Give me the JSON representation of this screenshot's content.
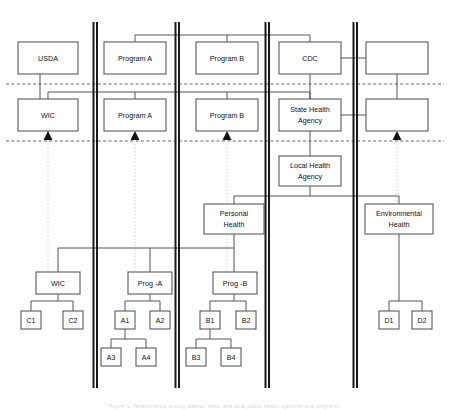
{
  "figure": {
    "caption": "Figure 1. Relationships among federal, state, and local public health agencies and programs.",
    "colors": {
      "box_stroke": "#4a4a4a",
      "connector": "#555555",
      "divider": "#1a1a1a",
      "ghost_link": "#c9c9c9",
      "text": "#111111",
      "background": "#ffffff"
    }
  },
  "tiers": {
    "federal": {
      "label": "Federal",
      "row_y": 60
    },
    "state": {
      "label": "State",
      "row_y": 115
    },
    "local": {
      "label": "Local",
      "row_y": 180
    }
  },
  "separators": [
    {
      "name": "federal-state-separator",
      "y": 84
    },
    {
      "name": "state-local-separator",
      "y": 141
    }
  ],
  "dividers": [
    {
      "name": "divider-1",
      "x": 95
    },
    {
      "name": "divider-2",
      "x": 177
    },
    {
      "name": "divider-3",
      "x": 267
    },
    {
      "name": "divider-4",
      "x": 355
    }
  ],
  "row_federal": [
    {
      "id": "usda",
      "label": "USDA",
      "x": 18,
      "y": 42,
      "w": 60,
      "h": 32
    },
    {
      "id": "fed-program-a",
      "label": "Program A",
      "x": 104,
      "y": 42,
      "w": 62,
      "h": 32
    },
    {
      "id": "fed-program-b",
      "label": "Program B",
      "x": 196,
      "y": 42,
      "w": 62,
      "h": 32
    },
    {
      "id": "cdc",
      "label": "CDC",
      "x": 279,
      "y": 42,
      "w": 62,
      "h": 32
    },
    {
      "id": "fed-blank",
      "label": "",
      "x": 366,
      "y": 42,
      "w": 62,
      "h": 32
    }
  ],
  "row_state": [
    {
      "id": "wic-state",
      "label": "WIC",
      "x": 18,
      "y": 99,
      "w": 60,
      "h": 32
    },
    {
      "id": "state-program-a",
      "label": "Program A",
      "x": 104,
      "y": 99,
      "w": 62,
      "h": 32
    },
    {
      "id": "state-program-b",
      "label": "Program B",
      "x": 196,
      "y": 99,
      "w": 62,
      "h": 32
    },
    {
      "id": "state-health-agency",
      "label": "State Health\nAgency",
      "line1": "State Health",
      "line2": "Agency",
      "x": 279,
      "y": 99,
      "w": 62,
      "h": 32
    },
    {
      "id": "state-blank",
      "label": "",
      "x": 366,
      "y": 99,
      "w": 62,
      "h": 32
    }
  ],
  "row_local": [
    {
      "id": "local-health-agency",
      "line1": "Local Health",
      "line2": "Agency",
      "x": 279,
      "y": 156,
      "w": 62,
      "h": 30
    },
    {
      "id": "personal-health",
      "line1": "Personal",
      "line2": "Health",
      "x": 204,
      "y": 204,
      "w": 60,
      "h": 30
    },
    {
      "id": "environmental-health",
      "line1": "Environmental",
      "line2": "Health",
      "x": 365,
      "y": 204,
      "w": 68,
      "h": 30
    }
  ],
  "row_programs": [
    {
      "id": "wic-local",
      "label": "WIC",
      "x": 36,
      "y": 272,
      "w": 44,
      "h": 22
    },
    {
      "id": "prog-a",
      "label": "Prog -A",
      "x": 128,
      "y": 272,
      "w": 44,
      "h": 22
    },
    {
      "id": "prog-b",
      "label": "Prog -B",
      "x": 213,
      "y": 272,
      "w": 44,
      "h": 22
    }
  ],
  "leaves": [
    {
      "id": "c1",
      "label": "C1",
      "x": 21,
      "y": 311,
      "w": 20,
      "h": 18
    },
    {
      "id": "c2",
      "label": "C2",
      "x": 63,
      "y": 311,
      "w": 20,
      "h": 18
    },
    {
      "id": "a1",
      "label": "A1",
      "x": 115,
      "y": 311,
      "w": 20,
      "h": 18
    },
    {
      "id": "a2",
      "label": "A2",
      "x": 150,
      "y": 311,
      "w": 20,
      "h": 18
    },
    {
      "id": "a3",
      "label": "A3",
      "x": 101,
      "y": 348,
      "w": 20,
      "h": 18
    },
    {
      "id": "a4",
      "label": "A4",
      "x": 136,
      "y": 348,
      "w": 20,
      "h": 18
    },
    {
      "id": "b1",
      "label": "B1",
      "x": 200,
      "y": 311,
      "w": 20,
      "h": 18
    },
    {
      "id": "b2",
      "label": "B2",
      "x": 236,
      "y": 311,
      "w": 20,
      "h": 18
    },
    {
      "id": "b3",
      "label": "B3",
      "x": 186,
      "y": 348,
      "w": 20,
      "h": 18
    },
    {
      "id": "b4",
      "label": "B4",
      "x": 221,
      "y": 348,
      "w": 20,
      "h": 18
    },
    {
      "id": "d1",
      "label": "D1",
      "x": 379,
      "y": 311,
      "w": 20,
      "h": 18
    },
    {
      "id": "d2",
      "label": "D2",
      "x": 412,
      "y": 311,
      "w": 20,
      "h": 18
    }
  ],
  "arrows": [
    {
      "name": "arrow-wic",
      "x": 48,
      "y": 141
    },
    {
      "name": "arrow-program-a",
      "x": 135,
      "y": 141
    },
    {
      "name": "arrow-program-b",
      "x": 227,
      "y": 141
    },
    {
      "name": "arrow-blank-right",
      "x": 397,
      "y": 141
    }
  ]
}
